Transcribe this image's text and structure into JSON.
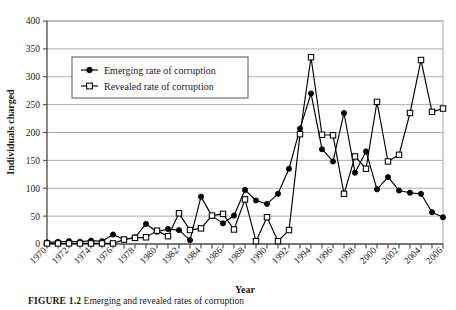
{
  "figure": {
    "caption_label": "FIGURE 1.2",
    "caption_text": "Emerging and revealed rates of corruption"
  },
  "chart_data": {
    "type": "line",
    "title": "",
    "xlabel": "Year",
    "ylabel": "Individuals charged",
    "xlim": [
      1970,
      2006
    ],
    "ylim": [
      0,
      400
    ],
    "yticks": [
      0,
      50,
      100,
      150,
      200,
      250,
      300,
      350,
      400
    ],
    "ytick_labels": [
      "0",
      "50",
      "100",
      "150",
      "200",
      "250",
      "300",
      "350",
      "400"
    ],
    "xticks": [
      1970,
      1971,
      1972,
      1973,
      1974,
      1975,
      1976,
      1977,
      1978,
      1979,
      1980,
      1981,
      1982,
      1983,
      1984,
      1985,
      1986,
      1987,
      1988,
      1989,
      1990,
      1991,
      1992,
      1993,
      1994,
      1995,
      1996,
      1997,
      1998,
      1999,
      2000,
      2001,
      2002,
      2003,
      2004,
      2005,
      2006
    ],
    "xtick_labels": [
      "1970",
      "1972",
      "1974",
      "1976",
      "1978",
      "1980",
      "1982",
      "1984",
      "1986",
      "1988",
      "1990",
      "1992",
      "1994",
      "1996",
      "1998",
      "2000",
      "2002",
      "2004",
      "2006"
    ],
    "xtick_label_years": [
      1970,
      1972,
      1974,
      1976,
      1978,
      1980,
      1982,
      1984,
      1986,
      1988,
      1990,
      1992,
      1994,
      1996,
      1998,
      2000,
      2002,
      2004,
      2006
    ],
    "grid": "horizontal",
    "legend_position": "upper-left-inside",
    "x": [
      1970,
      1971,
      1972,
      1973,
      1974,
      1975,
      1976,
      1977,
      1978,
      1979,
      1980,
      1981,
      1982,
      1983,
      1984,
      1985,
      1986,
      1987,
      1988,
      1989,
      1990,
      1991,
      1992,
      1993,
      1994,
      1995,
      1996,
      1997,
      1998,
      1999,
      2000,
      2001,
      2002,
      2003,
      2004,
      2005,
      2006
    ],
    "series": [
      {
        "name": "Emerging rate of corruption",
        "marker": "filled-circle",
        "color": "#000000",
        "values": [
          3,
          4,
          5,
          4,
          6,
          5,
          17,
          8,
          12,
          36,
          22,
          27,
          25,
          7,
          85,
          50,
          37,
          51,
          97,
          78,
          72,
          90,
          135,
          207,
          270,
          170,
          148,
          235,
          128,
          166,
          98,
          120,
          96,
          92,
          90,
          57,
          48
        ]
      },
      {
        "name": "Revealed rate of corruption",
        "marker": "open-square",
        "color": "#000000",
        "values": [
          1,
          1,
          1,
          1,
          1,
          1,
          1,
          8,
          11,
          12,
          24,
          14,
          55,
          25,
          28,
          51,
          54,
          26,
          80,
          5,
          48,
          5,
          25,
          197,
          335,
          196,
          195,
          90,
          157,
          135,
          255,
          148,
          160,
          235,
          330,
          237,
          243
        ]
      }
    ]
  },
  "legend": {
    "entries": [
      {
        "label": "Emerging rate of corruption",
        "marker": "filled-circle"
      },
      {
        "label": "Revealed rate of corruption",
        "marker": "open-square"
      }
    ]
  },
  "axes": {
    "y_title": "Individuals charged",
    "x_title": "Year"
  },
  "colors": {
    "line": "#000000",
    "grid": "#9a9a9a",
    "axis": "#4a4a4a",
    "background": "#ffffff"
  }
}
